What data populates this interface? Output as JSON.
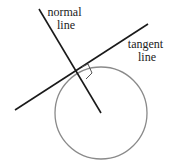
{
  "diagram": {
    "labels": {
      "normal_line": [
        "normal",
        "line"
      ],
      "tangent_line": [
        "tangent",
        "line"
      ]
    },
    "colors": {
      "lines": "#1a1a1a",
      "circle": "#8a8a8a",
      "text": "#222222"
    },
    "elements": {
      "circle": {
        "cx": 101,
        "cy": 113,
        "r": 46
      },
      "normal_line": {
        "x1": 39,
        "y1": 9,
        "x2": 101,
        "y2": 113
      },
      "tangent_line": {
        "x1": 15,
        "y1": 110,
        "x2": 148,
        "y2": 24
      },
      "right_angle_marker": true
    }
  }
}
